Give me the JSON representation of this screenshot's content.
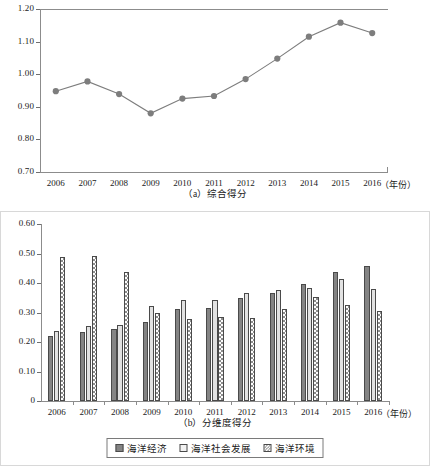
{
  "figure": {
    "panel_a_caption": "（a）综合得分",
    "panel_b_caption": "（b）分维度得分",
    "x_unit_label": "（年份）"
  },
  "legend": {
    "items": [
      {
        "name": "series-marine-economy",
        "label": "海洋经济",
        "style": "solid-dark-gray"
      },
      {
        "name": "series-marine-social-development",
        "label": "海洋社会发展",
        "style": "solid-light-gray"
      },
      {
        "name": "series-marine-environment",
        "label": "海洋环境",
        "style": "checkered"
      }
    ]
  },
  "chart_data": [
    {
      "type": "line",
      "title": "（a）综合得分",
      "xlabel": "（年份）",
      "ylabel": "",
      "x": [
        2006,
        2007,
        2008,
        2009,
        2010,
        2011,
        2012,
        2013,
        2014,
        2015,
        2016
      ],
      "xticklabels": [
        "2006",
        "2007",
        "2008",
        "2009",
        "2010",
        "2011",
        "2012",
        "2013",
        "2014",
        "2015",
        "2016"
      ],
      "values": [
        0.948,
        0.978,
        0.939,
        0.88,
        0.925,
        0.933,
        0.985,
        1.048,
        1.115,
        1.158,
        1.126
      ],
      "ylim": [
        0.7,
        1.2
      ],
      "yticks": [
        0.7,
        0.8,
        0.9,
        1.0,
        1.1,
        1.2
      ],
      "yticklabels": [
        "0.70",
        "0.80",
        "0.90",
        "1.00",
        "1.10",
        "1.20"
      ],
      "grid": false,
      "marker": "circle",
      "color": "#7d7d7d",
      "legend_position": "none"
    },
    {
      "type": "bar",
      "title": "（b）分维度得分",
      "xlabel": "（年份）",
      "ylabel": "",
      "categories": [
        "2006",
        "2007",
        "2008",
        "2009",
        "2010",
        "2011",
        "2012",
        "2013",
        "2014",
        "2015",
        "2016"
      ],
      "series": [
        {
          "name": "海洋经济",
          "values": [
            0.222,
            0.235,
            0.245,
            0.267,
            0.313,
            0.317,
            0.35,
            0.367,
            0.396,
            0.437,
            0.458
          ],
          "color": "#848484"
        },
        {
          "name": "海洋社会发展",
          "values": [
            0.239,
            0.253,
            0.259,
            0.322,
            0.341,
            0.342,
            0.365,
            0.378,
            0.382,
            0.413,
            0.379
          ],
          "color": "#e2e2e2"
        },
        {
          "name": "海洋环境",
          "values": [
            0.488,
            0.492,
            0.439,
            0.297,
            0.279,
            0.284,
            0.282,
            0.313,
            0.352,
            0.324,
            0.306
          ],
          "color": "#8e8e8e"
        }
      ],
      "ylim": [
        0,
        0.6
      ],
      "yticks": [
        0,
        0.1,
        0.2,
        0.3,
        0.4,
        0.5,
        0.6
      ],
      "yticklabels": [
        "0",
        "0.10",
        "0.20",
        "0.30",
        "0.40",
        "0.50",
        "0.60"
      ],
      "grid": false,
      "legend_position": "bottom"
    }
  ]
}
